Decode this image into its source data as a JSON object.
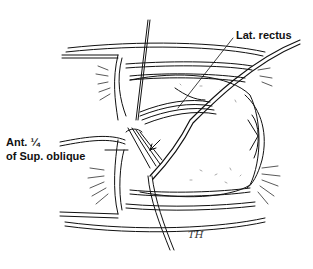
{
  "figure": {
    "type": "surgical line illustration",
    "labels": {
      "lat_rectus": "Lat. rectus",
      "ant_quarter_line1": "Ant. ¼",
      "ant_quarter_line2": "of Sup. oblique"
    },
    "signature": "TH",
    "colors": {
      "ink": "#111111",
      "background": "#ffffff"
    }
  }
}
